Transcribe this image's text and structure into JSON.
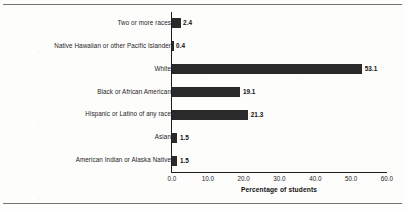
{
  "chart_data": {
    "type": "bar",
    "orientation": "horizontal",
    "title": "",
    "xlabel": "Percentage of students",
    "ylabel": "",
    "xlim": [
      0.0,
      60.0
    ],
    "xticks": [
      "0.0",
      "10.0",
      "20.0",
      "30.0",
      "40.0",
      "50.0",
      "60.0"
    ],
    "xtick_values": [
      0.0,
      10.0,
      20.0,
      30.0,
      40.0,
      50.0,
      60.0
    ],
    "grid": false,
    "legend": null,
    "bar_color": "#2a2a2a",
    "categories": [
      "Two or more races",
      "Native Hawaiian or other Pacific Islander",
      "White",
      "Black or African American",
      "Hispanic or Latino of any race",
      "Asian",
      "American Indian or Alaska Native"
    ],
    "values": [
      2.4,
      0.4,
      53.1,
      19.1,
      21.3,
      1.5,
      1.5
    ],
    "value_labels": [
      "2.4",
      "0.4",
      "53.1",
      "19.1",
      "21.3",
      "1.5",
      "1.5"
    ]
  }
}
